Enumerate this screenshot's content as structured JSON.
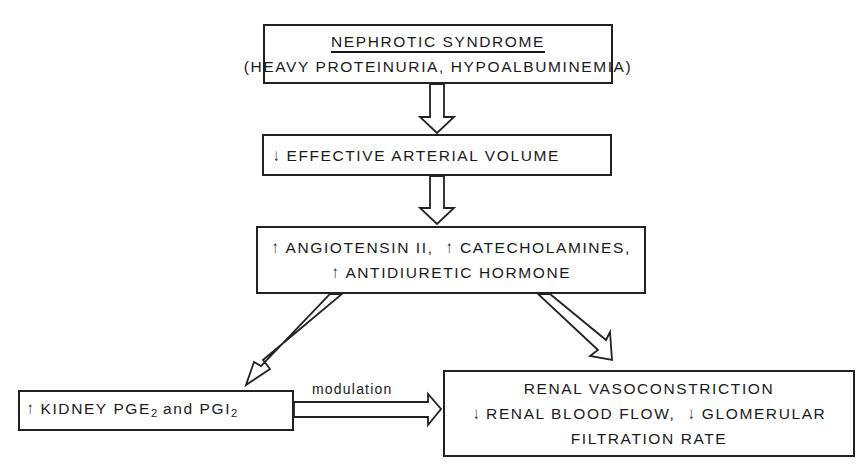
{
  "nodes": {
    "nephrotic": {
      "title": "NEPHROTIC SYNDROME",
      "subtitle": "(HEAVY PROTEINURIA, HYPOALBUMINEMIA)"
    },
    "arterial_volume": {
      "indicator": "↓",
      "label": "EFFECTIVE ARTERIAL VOLUME"
    },
    "hormones": {
      "items": [
        {
          "indicator": "↑",
          "label": "ANGIOTENSIN II,"
        },
        {
          "indicator": "↑",
          "label": "CATECHOLAMINES,"
        },
        {
          "indicator": "↑",
          "label": "ANTIDIURETIC HORMONE"
        }
      ]
    },
    "kidney_pg": {
      "indicator": "↑",
      "prefix": "KIDNEY PGE",
      "sub1": "2",
      "middle": " and PGI",
      "sub2": "2"
    },
    "renal": {
      "line1": "RENAL VASOCONSTRICTION",
      "ind1": "↓",
      "line2a": "RENAL BLOOD FLOW,",
      "ind2": "↓",
      "line2b": "GLOMERULAR",
      "line3": "FILTRATION RATE"
    }
  },
  "edges": {
    "modulation_label": "modulation"
  }
}
